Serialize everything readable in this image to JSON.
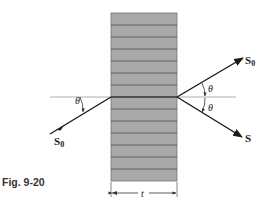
{
  "figure": {
    "caption": "Fig. 9-20",
    "crystal": {
      "layers": 15,
      "fill": "#a9a9a9",
      "line_color": "#555555",
      "thickness_label": "t"
    },
    "rays": {
      "incident_label": "S",
      "incident_subscript": "0",
      "transmitted_label": "S",
      "transmitted_subscript": "0",
      "diffracted_label": "S",
      "angle_symbol": "θ"
    },
    "colors": {
      "ray": "#1a1a1a",
      "reference_line": "#9a9a9a"
    }
  }
}
